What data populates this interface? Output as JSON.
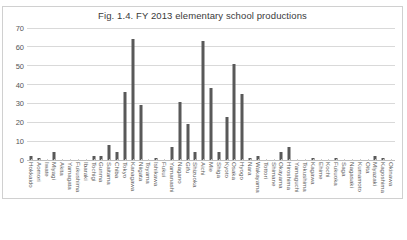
{
  "page": {
    "ghost_text_above_chart": "",
    "background_color": "#ffffff"
  },
  "chart": {
    "title": "Fig. 1.4. FY 2013 elementary school productions",
    "frame_border_color": "#d0d0d0",
    "bar_color": "#595959",
    "gridline_color": "#d9d9d9",
    "axis_text_color": "#555555"
  },
  "chart_data": {
    "type": "bar",
    "title": "Fig. 1.4. FY 2013 elementary school productions",
    "xlabel": "",
    "ylabel": "",
    "ylim": [
      0,
      70
    ],
    "yticks": [
      0,
      10,
      20,
      30,
      40,
      50,
      60,
      70
    ],
    "ytick_labels": [
      "0",
      "10",
      "20",
      "30",
      "40",
      "50",
      "60",
      "70"
    ],
    "grid": true,
    "legend": "none",
    "orientation": "vertical",
    "categories": [
      "Hokkaido",
      "Aomori",
      "Iwate",
      "Miyagi",
      "Akita",
      "Yamagata",
      "Fukushima",
      "Ibaraki",
      "Tochigi",
      "Gunma",
      "Saitama",
      "Chiba",
      "Tokyo",
      "Kanagawa",
      "Niigata",
      "Toyama",
      "Ishikawa",
      "Fukui",
      "Yamanashi",
      "Nagano",
      "Gifu",
      "Shizuoka",
      "Aichi",
      "Mie",
      "Shiga",
      "Kyoto",
      "Osaka",
      "Hyogo",
      "Nara",
      "Wakayama",
      "Tottori",
      "Shimane",
      "Okayama",
      "Hiroshima",
      "Yamaguchi",
      "Tokushima",
      "Kagawa",
      "Ehime",
      "Kochi",
      "Fukuoka",
      "Saga",
      "Nagasaki",
      "Kumamoto",
      "Oita",
      "Miyazaki",
      "Kagoshima",
      "Okinawa"
    ],
    "values": [
      2,
      1,
      0,
      4,
      0,
      0,
      0,
      0,
      2,
      2,
      8,
      4,
      36,
      64,
      29,
      0,
      1,
      0,
      7,
      31,
      19,
      4,
      63,
      38,
      4,
      23,
      51,
      35,
      1,
      2,
      0,
      0,
      4,
      7,
      0,
      0,
      1,
      0,
      0,
      1,
      0,
      0,
      0,
      0,
      2,
      1,
      0
    ]
  }
}
